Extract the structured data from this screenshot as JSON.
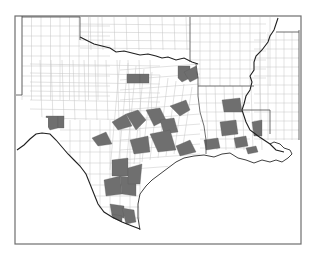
{
  "map": {
    "title": "",
    "region": "Texas, Louisiana and neighboring states — county level",
    "colors": {
      "background": "#ffffff",
      "frame": "#6e6e6e",
      "county_border": "#c4c4c4",
      "state_border": "#4a4a4a",
      "river": "#1f1f1f",
      "highlighted_fill": "#6f6f6f",
      "unselected_fill": "#ffffff"
    },
    "states_visible": [
      "Texas",
      "Oklahoma",
      "Arkansas",
      "Louisiana",
      "Mississippi",
      "New Mexico"
    ],
    "legend": null,
    "highlighted_counties": [
      {
        "id": "tx-north-central-1",
        "state": "Texas",
        "area": "north-central"
      },
      {
        "id": "tx-north-central-2",
        "state": "Texas",
        "area": "north-central"
      },
      {
        "id": "tx-northeast-1",
        "state": "Texas",
        "area": "northeast"
      },
      {
        "id": "tx-northeast-2",
        "state": "Texas",
        "area": "northeast"
      },
      {
        "id": "tx-east-1",
        "state": "Texas",
        "area": "east"
      },
      {
        "id": "tx-east-2",
        "state": "Texas",
        "area": "east"
      },
      {
        "id": "tx-west-1",
        "state": "Texas",
        "area": "west"
      },
      {
        "id": "tx-west-2",
        "state": "Texas",
        "area": "west"
      },
      {
        "id": "tx-central-1",
        "state": "Texas",
        "area": "central"
      },
      {
        "id": "tx-central-2",
        "state": "Texas",
        "area": "central"
      },
      {
        "id": "tx-central-3",
        "state": "Texas",
        "area": "central"
      },
      {
        "id": "tx-central-4",
        "state": "Texas",
        "area": "central"
      },
      {
        "id": "tx-central-5",
        "state": "Texas",
        "area": "central"
      },
      {
        "id": "tx-southeast-1",
        "state": "Texas",
        "area": "southeast"
      },
      {
        "id": "tx-southeast-2",
        "state": "Texas",
        "area": "southeast"
      },
      {
        "id": "tx-southeast-3",
        "state": "Texas",
        "area": "southeast"
      },
      {
        "id": "tx-south-1",
        "state": "Texas",
        "area": "south"
      },
      {
        "id": "tx-south-2",
        "state": "Texas",
        "area": "south"
      },
      {
        "id": "tx-south-3",
        "state": "Texas",
        "area": "south"
      },
      {
        "id": "tx-coastal-bend-1",
        "state": "Texas",
        "area": "coastal-bend"
      },
      {
        "id": "tx-coastal-bend-2",
        "state": "Texas",
        "area": "coastal-bend"
      },
      {
        "id": "tx-valley-1",
        "state": "Texas",
        "area": "rio-grande-valley"
      },
      {
        "id": "tx-valley-2",
        "state": "Texas",
        "area": "rio-grande-valley"
      },
      {
        "id": "la-central-1",
        "state": "Louisiana",
        "area": "central"
      },
      {
        "id": "la-southwest-1",
        "state": "Louisiana",
        "area": "southwest"
      },
      {
        "id": "la-south-1",
        "state": "Louisiana",
        "area": "south"
      },
      {
        "id": "la-east-1",
        "state": "Louisiana",
        "area": "east"
      },
      {
        "id": "la-coast-1",
        "state": "Louisiana",
        "area": "coast"
      }
    ]
  }
}
